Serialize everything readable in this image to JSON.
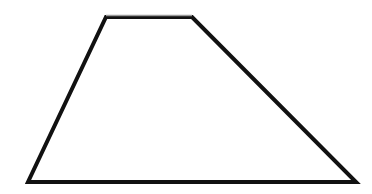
{
  "figure": {
    "shape": "trapezoid",
    "stroke_color": "#111111",
    "top_edge_color": "#9a9a9a",
    "fill": "none",
    "stroke_width": 4,
    "vertices": {
      "top_left": [
        106,
        17
      ],
      "top_right": [
        192,
        17
      ],
      "bottom_right": [
        356,
        182
      ],
      "bottom_left": [
        28,
        182
      ]
    }
  }
}
